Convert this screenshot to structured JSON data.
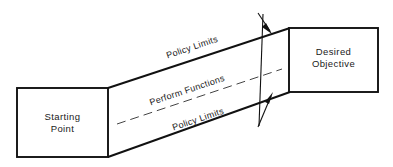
{
  "diagram": {
    "background_color": "#ffffff",
    "line_color": "#111111",
    "dash_color": "#444444",
    "start_box": {
      "label_line1": "Starting",
      "label_line2": "Point"
    },
    "end_box": {
      "label_line1": "Desired",
      "label_line2": "Objective"
    },
    "labels": {
      "top_limit": "Policy Limits",
      "center_path": "Perform Functions",
      "bottom_limit": "Policy Limits"
    },
    "section_marker": {
      "name": "section-plane",
      "arrow_top": "down-right",
      "arrow_bottom": "up-right"
    }
  }
}
